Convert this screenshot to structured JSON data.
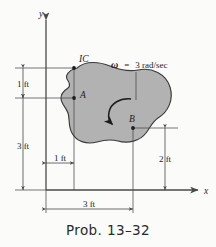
{
  "figure": {
    "caption": "Prob. 13–32",
    "axis": {
      "y_label": "y",
      "x_label": "x"
    },
    "points": [
      {
        "id": "ic",
        "label": "IC"
      },
      {
        "id": "a",
        "label": "A"
      },
      {
        "id": "b",
        "label": "B"
      }
    ],
    "angular_velocity": {
      "symbol": "ω",
      "equals": "=",
      "value": "3 rad/sec",
      "full": "ω = 3 rad/sec",
      "sense": "counterclockwise"
    },
    "dimensions": [
      {
        "id": "dim-1ft-vert-top",
        "label": "1 ft",
        "orientation": "vertical"
      },
      {
        "id": "dim-3ft-vert-left",
        "label": "3 ft",
        "orientation": "vertical"
      },
      {
        "id": "dim-1ft-horz",
        "label": "1 ft",
        "orientation": "horizontal"
      },
      {
        "id": "dim-2ft-vert-right",
        "label": "2 ft",
        "orientation": "vertical"
      },
      {
        "id": "dim-3ft-horz-bottom",
        "label": "3 ft",
        "orientation": "horizontal"
      }
    ],
    "colors": {
      "body_fill": "#b2b2b2",
      "body_stroke": "#3a3a3a",
      "line": "#4a4a4a",
      "background": "#fbfbfa",
      "text": "#1d1d1d"
    }
  }
}
